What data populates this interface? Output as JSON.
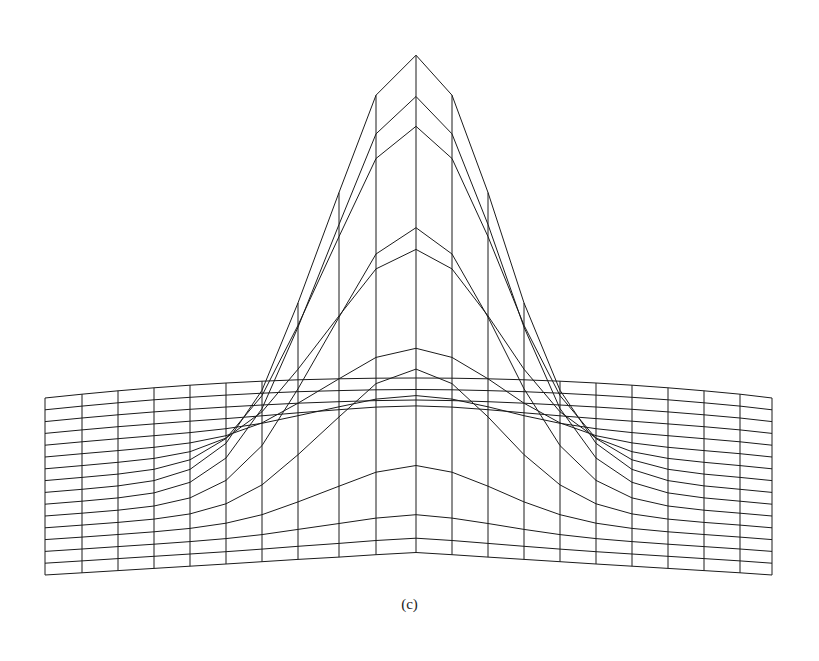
{
  "figure": {
    "caption": "(c)",
    "line_color": "#1a1a1a",
    "background": "#ffffff"
  },
  "chart_data": {
    "type": "surface-wireframe",
    "title": "",
    "label": "(c)",
    "surface": "gaussian peak",
    "grid": {
      "columns": 21,
      "rows": 16,
      "column_x_px": [
        45,
        82,
        118,
        154,
        190,
        226,
        262,
        298,
        339,
        376,
        416,
        452,
        488,
        524,
        560,
        596,
        632,
        668,
        704,
        740,
        772
      ]
    },
    "peak": {
      "x_px": 416,
      "y_px": 35
    },
    "base_plane": {
      "back_edge_y_px": 378,
      "front_edge_y_px": 553,
      "left_x_px": 45,
      "right_x_px": 772
    },
    "axes": "none"
  }
}
